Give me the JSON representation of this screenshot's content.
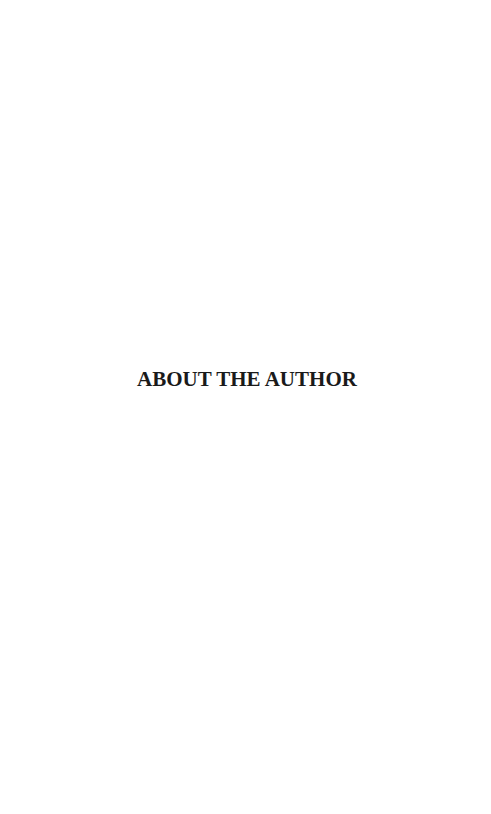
{
  "page": {
    "background_color": "#ffffff",
    "text_color": "#1a1a1a",
    "section_title": "ABOUT THE AUTHOR"
  }
}
